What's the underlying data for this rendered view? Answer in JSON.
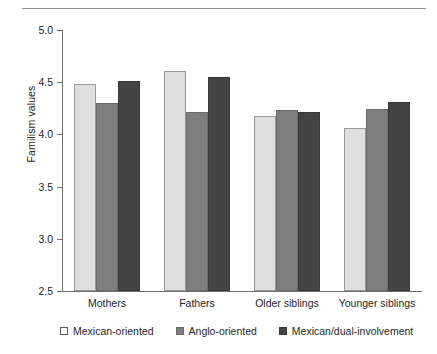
{
  "chart_data": {
    "type": "bar",
    "title": "",
    "xlabel": "",
    "ylabel": "Familism values",
    "categories": [
      "Mothers",
      "Fathers",
      "Older siblings",
      "Younger siblings"
    ],
    "series": [
      {
        "name": "Mexican-oriented",
        "color": "#dedede",
        "values": [
          4.48,
          4.61,
          4.18,
          4.06
        ]
      },
      {
        "name": "Anglo-oriented",
        "color": "#7e7e7e",
        "values": [
          4.3,
          4.21,
          4.23,
          4.24
        ]
      },
      {
        "name": "Mexican/dual-involvement",
        "color": "#434343",
        "values": [
          4.51,
          4.55,
          4.21,
          4.31
        ]
      }
    ],
    "ylim": [
      2.5,
      5.0
    ],
    "yticks": [
      "2.5",
      "3.0",
      "3.5",
      "4.0",
      "4.5",
      "5.0"
    ],
    "ytick_values": [
      2.5,
      3.0,
      3.5,
      4.0,
      4.5,
      5.0
    ],
    "grid": false,
    "legend_position": "bottom"
  }
}
